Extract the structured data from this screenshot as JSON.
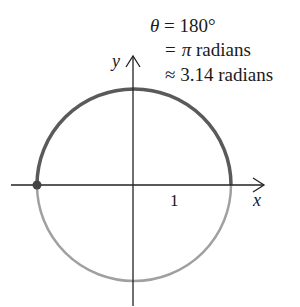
{
  "diagram": {
    "type": "unit-circle-angle",
    "angle_lines": {
      "line1": "θ = 180°",
      "line2": "= π radians",
      "line3": "≈ 3.14 radians"
    },
    "line1": {
      "theta": "θ",
      "rest": " = 180°"
    },
    "line2": {
      "eq": "=",
      "pi": "π",
      "rest": " radians"
    },
    "line3": {
      "approx": "≈",
      "rest": " 3.14 radians"
    },
    "axes": {
      "x_label": "x",
      "y_label": "y",
      "tick_label": "1"
    },
    "colors": {
      "traced_arc": "#5a5a5a",
      "untraced_arc": "#a0a0a0",
      "axis": "#222222",
      "point": "#444444"
    }
  }
}
